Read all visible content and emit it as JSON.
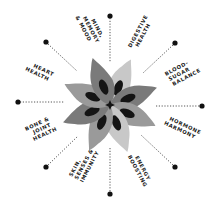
{
  "diagram": {
    "center": {
      "x": 110,
      "y": 105
    },
    "colors": {
      "text": "#1a1a1a",
      "dot": "#111111",
      "line": "#444444",
      "petal_light": "#c8c8c8",
      "petal_mid": "#9a9a9a",
      "petal_dark": "#7a7a7a",
      "petal_inner": "#141414"
    },
    "center_icon": "star-icon",
    "labels": [
      {
        "id": "mind",
        "lines": [
          "MIND,",
          "MEMORY",
          "& MOOD"
        ]
      },
      {
        "id": "digestive",
        "lines": [
          "DIGESTIVE",
          "HEALTH"
        ]
      },
      {
        "id": "blood-sugar",
        "lines": [
          "BLOOD-",
          "SUGAR",
          "BALANCE"
        ]
      },
      {
        "id": "hormone",
        "lines": [
          "HORMONE",
          "HARMONY"
        ]
      },
      {
        "id": "energy",
        "lines": [
          "ENERGY",
          "BOOSTING"
        ]
      },
      {
        "id": "skin",
        "lines": [
          "SKIN,",
          "SENSES &",
          "IMMUNITY"
        ]
      },
      {
        "id": "bone",
        "lines": [
          "BONE &",
          "JOINT",
          "HEALTH"
        ]
      },
      {
        "id": "heart",
        "lines": [
          "HEART",
          "HEALTH"
        ]
      }
    ]
  }
}
